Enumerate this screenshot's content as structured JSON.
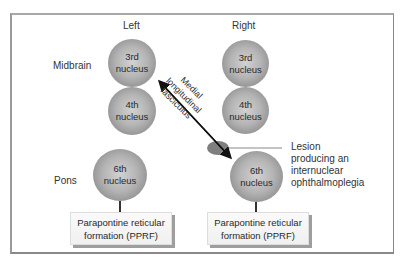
{
  "columns": {
    "left": "Left",
    "right": "Right"
  },
  "regions": {
    "midbrain": "Midbrain",
    "pons": "Pons"
  },
  "nuclei": {
    "left_3rd": [
      "3rd",
      "nucleus"
    ],
    "left_4th": [
      "4th",
      "nucleus"
    ],
    "left_6th": [
      "6th",
      "nucleus"
    ],
    "right_3rd": [
      "3rd",
      "nucleus"
    ],
    "right_4th": [
      "4th",
      "nucleus"
    ],
    "right_6th": [
      "6th",
      "nucleus"
    ]
  },
  "pprf": {
    "left": [
      "Parapontine reticular",
      "formation (PPRF)"
    ],
    "right": [
      "Parapontine reticular",
      "formation (PPRF)"
    ]
  },
  "tract": {
    "lines": [
      "Medial",
      "longitudinal",
      "fasciculus"
    ]
  },
  "lesion": {
    "lines": [
      "Lesion",
      "producing an",
      "internuclear",
      "ophthalmoplegia"
    ]
  },
  "colors": {
    "nucleus": "#a8a8a8",
    "lesion": "#7f7f7f",
    "frame": "#999999",
    "text": "#333333"
  }
}
